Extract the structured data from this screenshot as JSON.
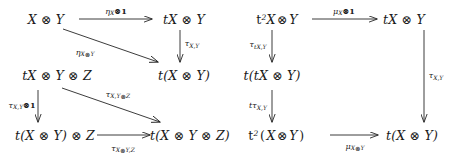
{
  "diagram": {
    "stroke_color": "#262626",
    "left": {
      "name": "strength-compatibility-diagram",
      "nodes": [
        {
          "id": "l-tl",
          "text": "X ⊗ Y"
        },
        {
          "id": "l-tr",
          "text": "tX ⊗ Y"
        },
        {
          "id": "l-ml",
          "text": "tX ⊗ Y ⊗ Z"
        },
        {
          "id": "l-mr",
          "text": "t(X ⊗ Y)"
        },
        {
          "id": "l-bl",
          "text": "t(X ⊗ Y) ⊗ Z"
        },
        {
          "id": "l-br",
          "text": "t(X ⊗ Y ⊗ Z)"
        }
      ],
      "arrows": [
        {
          "id": "l-top",
          "label": "ηX⊗1",
          "base": "η",
          "sub": "X",
          "rest": "⊗1"
        },
        {
          "id": "l-diag1",
          "label": "ηX⊗Y",
          "base": "η",
          "sub": "X⊗Y",
          "rest": ""
        },
        {
          "id": "l-right1",
          "label": "τX,Y",
          "base": "τ",
          "sub": "X,Y",
          "rest": ""
        },
        {
          "id": "l-left-vert",
          "label": "τX,Y⊗1",
          "base": "τ",
          "sub": "X,Y",
          "rest": "⊗1"
        },
        {
          "id": "l-diag2",
          "label": "τX,Y⊗Z",
          "base": "τ",
          "sub": "X,Y⊗Z",
          "rest": ""
        },
        {
          "id": "l-bottom",
          "label": "τX⊗Y,Z",
          "base": "τ",
          "sub": "X⊗Y,Z",
          "rest": ""
        }
      ]
    },
    "right": {
      "name": "multiplication-compatibility-diagram",
      "nodes": [
        {
          "id": "r-tl",
          "text": "t²X ⊗ Y"
        },
        {
          "id": "r-tr",
          "text": "tX ⊗ Y"
        },
        {
          "id": "r-ml",
          "text": "t(tX ⊗ Y)"
        },
        {
          "id": "r-bl",
          "text": "t²(X ⊗ Y)"
        },
        {
          "id": "r-br",
          "text": "t(X ⊗ Y)"
        }
      ],
      "arrows": [
        {
          "id": "r-top",
          "label": "μX⊗1",
          "base": "μ",
          "sub": "X",
          "rest": "⊗1"
        },
        {
          "id": "r-left1",
          "label": "τtX,Y",
          "base": "τ",
          "sub": "tX,Y",
          "rest": ""
        },
        {
          "id": "r-left2",
          "label": "tτX,Y",
          "base": "tτ",
          "sub": "X,Y",
          "rest": ""
        },
        {
          "id": "r-right",
          "label": "τX,Y",
          "base": "τ",
          "sub": "X,Y",
          "rest": ""
        },
        {
          "id": "r-bottom",
          "label": "μX⊗Y",
          "base": "μ",
          "sub": "X⊗Y",
          "rest": ""
        }
      ]
    }
  }
}
